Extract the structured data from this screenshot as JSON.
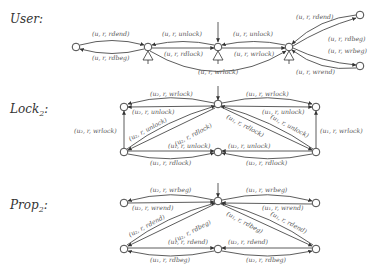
{
  "sections": [
    {
      "id": "user",
      "label": "User:",
      "edges": [
        {
          "label": "(u, r, rdend)"
        },
        {
          "label": "(u, r, rdbeg)"
        },
        {
          "label": "(u, r, unlock)"
        },
        {
          "label": "(u, r, rdlock)"
        },
        {
          "label": "(u, r, unlock)"
        },
        {
          "label": "(u, r, wrlock)"
        },
        {
          "label": "(u, r, wrlock)"
        },
        {
          "label": "(u, r, rdend)"
        },
        {
          "label": "(u, r, rdbeg)"
        },
        {
          "label": "(u, r, wrbeg)"
        },
        {
          "label": "(u, r, wrend)"
        }
      ],
      "accepting_symbol": "ψ"
    },
    {
      "id": "lock2",
      "label": "Lock",
      "label_sub": "2",
      "label_suffix": ":",
      "edges": [
        {
          "label": "(u₂, r, wrlock)"
        },
        {
          "label": "(u₂, r, unlock)"
        },
        {
          "label": "(u₁, r, wrlock)"
        },
        {
          "label": "(u₁, r, unlock)"
        },
        {
          "label": "(u₂, r, wrlock)"
        },
        {
          "label": "(u₂, r, unlock)"
        },
        {
          "label": "(u₂, r, rdlock)"
        },
        {
          "label": "(u₁, r, rdlock)"
        },
        {
          "label": "(u₁, r, unlock)"
        },
        {
          "label": "(u₁, r, wrlock)"
        },
        {
          "label": "(u₁, r, unlock)"
        },
        {
          "label": "(u₁, r, rdlock)"
        },
        {
          "label": "(u₂, r, unlock)"
        },
        {
          "label": "(u₂, r, rdlock)"
        }
      ]
    },
    {
      "id": "prop2",
      "label": "Prop",
      "label_sub": "2",
      "label_suffix": ":",
      "edges": [
        {
          "label": "(u₂, r, wrbeg)"
        },
        {
          "label": "(u₂, r, wrend)"
        },
        {
          "label": "(u₁, r, wrbeg)"
        },
        {
          "label": "(u₁, r, wrend)"
        },
        {
          "label": "(u₂, r, rdend)"
        },
        {
          "label": "(u₂, r, rdbeg)"
        },
        {
          "label": "(u₁, r, rdbeg)"
        },
        {
          "label": "(u₁, r, rdend)"
        },
        {
          "label": "(u₁, r, rdend)"
        },
        {
          "label": "(u₁, r, rdbeg)"
        },
        {
          "label": "(u₂, r, rdend)"
        },
        {
          "label": "(u₂, r, rdbeg)"
        }
      ]
    }
  ]
}
